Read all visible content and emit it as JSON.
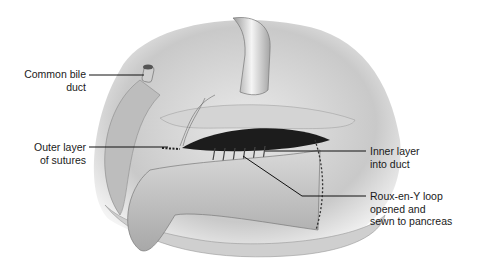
{
  "figure": {
    "labels": {
      "common_bile_duct": [
        "Common bile",
        "duct"
      ],
      "outer_layer": [
        "Outer layer",
        "of sutures"
      ],
      "inner_layer": [
        "Inner layer",
        "into duct"
      ],
      "roux_loop": [
        "Roux-en-Y loop",
        "opened and",
        "sewn to pancreas"
      ]
    }
  }
}
